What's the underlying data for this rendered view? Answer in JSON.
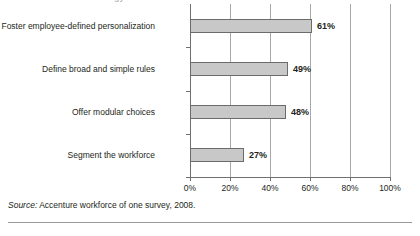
{
  "figure": {
    "clipped_title_remnant": "workforce of one strategy",
    "source_prefix": "Source:",
    "source_text": " Accenture workforce of one survey, 2008."
  },
  "chart_data": {
    "type": "bar",
    "orientation": "horizontal",
    "title": "",
    "xlabel": "",
    "ylabel": "",
    "categories": [
      "Foster employee-defined personalization",
      "Define broad and simple rules",
      "Offer modular choices",
      "Segment the workforce"
    ],
    "values": [
      61,
      49,
      48,
      27
    ],
    "value_labels": [
      "61%",
      "49%",
      "48%",
      "27%"
    ],
    "xlim": [
      0,
      100
    ],
    "xticks": [
      0,
      20,
      40,
      60,
      80,
      100
    ],
    "xtick_labels": [
      "0%",
      "20%",
      "40%",
      "60%",
      "80%",
      "100%"
    ],
    "grid": true,
    "legend": false,
    "bar_fill_color": "#c8c8c8",
    "bar_border_color": "#6b6b6b",
    "axis_color": "#6f6f6f",
    "gridline_color": "#a8a8a8"
  }
}
